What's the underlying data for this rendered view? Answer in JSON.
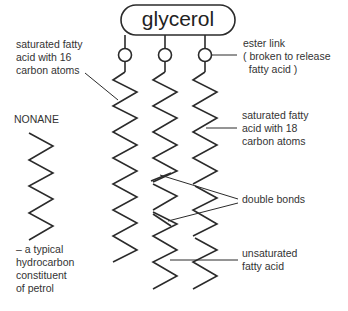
{
  "diagram": {
    "title": "glycerol",
    "labels": {
      "saturated_16": [
        "saturated fatty",
        "acid with 16",
        "carbon atoms"
      ],
      "ester_link": [
        "ester link",
        "( broken to release",
        "  fatty acid )"
      ],
      "saturated_18": [
        "saturated fatty",
        "acid with 18",
        "carbon atoms"
      ],
      "double_bonds": "double bonds",
      "unsaturated": [
        "unsaturated",
        "fatty acid"
      ],
      "nonane_title": "NONANE",
      "nonane_desc": [
        "– a typical",
        "hydrocarbon",
        "constituent",
        "of petrol"
      ]
    },
    "colors": {
      "line": "#2b2b2b",
      "text": "#333333",
      "background": "#ffffff"
    }
  }
}
